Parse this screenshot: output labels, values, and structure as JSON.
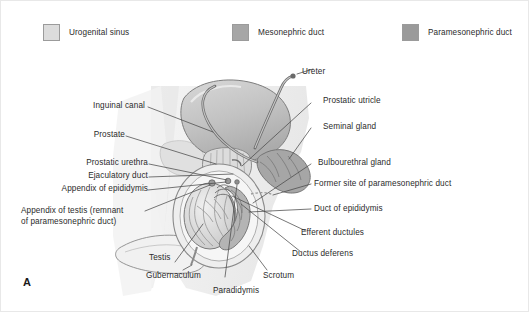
{
  "figure": {
    "panel_letter": "A",
    "background_color": "#ffffff",
    "border_color": "#e8e8e8"
  },
  "legend": {
    "items": [
      {
        "label": "Urogenital sinus",
        "color": "#dcdcdc",
        "swatch": "legend-swatch-urogenital-sinus"
      },
      {
        "label": "Mesonephric duct",
        "color": "#a6a6a6",
        "swatch": "legend-swatch-mesonephric-duct"
      },
      {
        "label": "Paramesonephric duct",
        "color": "#9a9a9a",
        "swatch": "legend-swatch-paramesonephric-duct"
      }
    ]
  },
  "labels": {
    "left": [
      {
        "id": "inguinal-canal",
        "text": "Inguinal canal"
      },
      {
        "id": "prostate",
        "text": "Prostate"
      },
      {
        "id": "prostatic-urethra",
        "text": "Prostatic urethra"
      },
      {
        "id": "ejaculatory-duct",
        "text": "Ejaculatory duct"
      },
      {
        "id": "appendix-of-epididymis",
        "text": "Appendix of epididymis"
      },
      {
        "id": "appendix-of-testis",
        "text": "Appendix of testis (remnant\nof paramesonephric duct)"
      },
      {
        "id": "testis",
        "text": "Testis"
      }
    ],
    "right": [
      {
        "id": "ureter",
        "text": "Ureter"
      },
      {
        "id": "prostatic-utricle",
        "text": "Prostatic utricle"
      },
      {
        "id": "seminal-gland",
        "text": "Seminal gland"
      },
      {
        "id": "bulbourethral-gland",
        "text": "Bulbourethral gland"
      },
      {
        "id": "former-site-of-paramesonephric-duct",
        "text": "Former site of paramesonephric duct"
      },
      {
        "id": "duct-of-epididymis",
        "text": "Duct of epididymis"
      },
      {
        "id": "efferent-ductules",
        "text": "Efferent ductules"
      },
      {
        "id": "ductus-deferens",
        "text": "Ductus deferens"
      }
    ],
    "bottom": [
      {
        "id": "gubernaculum",
        "text": "Gubernaculum"
      },
      {
        "id": "paradidymis",
        "text": "Paradidymis"
      },
      {
        "id": "scrotum",
        "text": "Scrotum"
      }
    ]
  },
  "illustration": {
    "title": "male-reproductive-tract-development-diagram",
    "palette": {
      "urogenital_sinus": "#dcdcdc",
      "mesonephric_duct": "#a6a6a6",
      "paramesonephric_duct": "#9a9a9a",
      "outline": "#6e6e6e",
      "bladder_fill": "#c9c9c9",
      "body_tint": "#efefef",
      "leader_line": "#4a4a4a"
    }
  }
}
